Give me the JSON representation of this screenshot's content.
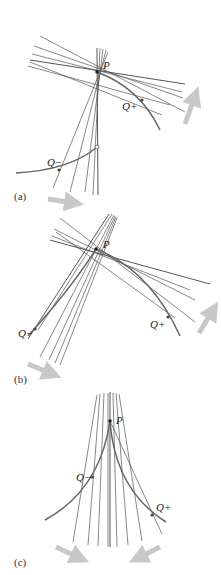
{
  "figure": {
    "panels": [
      {
        "id": "a",
        "label": "(a)",
        "point_p": "P",
        "point_q_minus": "Q−",
        "point_q_plus": "Q+"
      },
      {
        "id": "b",
        "label": "(b)",
        "point_p": "P",
        "point_q_minus": "Q−",
        "point_q_plus": "Q+"
      },
      {
        "id": "c",
        "label": "(c)",
        "point_p": "P",
        "point_q_minus": "Q−",
        "point_q_plus": "Q+"
      }
    ],
    "colors": {
      "line": "#555555",
      "curve": "#666666",
      "arrow": "#c8c8c8"
    }
  }
}
